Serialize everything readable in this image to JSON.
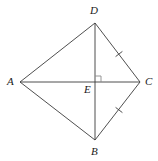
{
  "figure": {
    "kind": "geometry-diagram",
    "canvas": {
      "width": 158,
      "height": 161,
      "background": "#ffffff"
    },
    "style": {
      "stroke_color": "#3b3b3b",
      "stroke_width": 0.9,
      "label_color": "#1a1a1a",
      "label_font_size": 11
    },
    "points": [
      {
        "id": "A",
        "label": "A",
        "x": 20,
        "y": 82,
        "label_x": 7,
        "label_y": 76
      },
      {
        "id": "B",
        "label": "B",
        "x": 95,
        "y": 140,
        "label_x": 91,
        "label_y": 146
      },
      {
        "id": "C",
        "label": "C",
        "x": 140,
        "y": 82,
        "label_x": 145,
        "label_y": 76
      },
      {
        "id": "D",
        "label": "D",
        "x": 95,
        "y": 23,
        "label_x": 90,
        "label_y": 5
      },
      {
        "id": "E",
        "label": "E",
        "x": 95,
        "y": 82,
        "label_x": 84,
        "label_y": 84
      }
    ],
    "segments": [
      {
        "id": "AD",
        "from": "A",
        "to": "D",
        "ticks": 0
      },
      {
        "id": "DC",
        "from": "D",
        "to": "C",
        "ticks": 1
      },
      {
        "id": "CB",
        "from": "C",
        "to": "B",
        "ticks": 1
      },
      {
        "id": "BA",
        "from": "B",
        "to": "A",
        "ticks": 0
      },
      {
        "id": "AC",
        "from": "A",
        "to": "C",
        "ticks": 0
      },
      {
        "id": "DB",
        "from": "D",
        "to": "B",
        "ticks": 0
      }
    ],
    "tick_marks": [
      {
        "id": "tick-dc",
        "on": "DC",
        "x": 119,
        "y": 54
      },
      {
        "id": "tick-cb",
        "on": "CB",
        "x": 119,
        "y": 110
      }
    ],
    "right_angle": {
      "id": "right-angle-at-E",
      "vertex": "E",
      "size": 6,
      "x": 96,
      "y": 76
    }
  }
}
